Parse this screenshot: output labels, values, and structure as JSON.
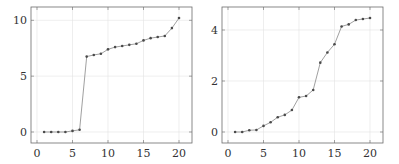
{
  "chart_data": [
    {
      "type": "line",
      "title": "",
      "xlabel": "",
      "ylabel": "",
      "x": [
        1,
        2,
        3,
        4,
        5,
        6,
        7,
        8,
        9,
        10,
        11,
        12,
        13,
        14,
        15,
        16,
        17,
        18,
        19,
        20
      ],
      "values": [
        0.0,
        0.0,
        0.0,
        0.0,
        0.1,
        0.2,
        6.75,
        6.9,
        7.0,
        7.4,
        7.6,
        7.7,
        7.8,
        7.9,
        8.2,
        8.4,
        8.5,
        8.6,
        9.3,
        10.2
      ],
      "xlim": [
        -1,
        22
      ],
      "ylim": [
        -1,
        11.2
      ],
      "xticks": [
        "0",
        "5",
        "10",
        "15",
        "20"
      ],
      "yticks": [
        "0",
        "5",
        "10"
      ],
      "grid": true,
      "legend": null
    },
    {
      "type": "line",
      "title": "",
      "xlabel": "",
      "ylabel": "",
      "x": [
        1,
        2,
        3,
        4,
        5,
        6,
        7,
        8,
        9,
        10,
        11,
        12,
        13,
        14,
        15,
        16,
        17,
        18,
        19,
        20
      ],
      "values": [
        0.0,
        0.0,
        0.07,
        0.08,
        0.24,
        0.38,
        0.58,
        0.67,
        0.86,
        1.36,
        1.41,
        1.65,
        2.72,
        3.12,
        3.44,
        4.14,
        4.22,
        4.39,
        4.43,
        4.47
      ],
      "xlim": [
        -1,
        22
      ],
      "ylim": [
        -0.43,
        4.9
      ],
      "xticks": [
        "0",
        "5",
        "10",
        "15",
        "20"
      ],
      "yticks": [
        "0",
        "2",
        "4"
      ],
      "grid": true,
      "legend": null
    }
  ],
  "panels": [
    {
      "frame": {
        "left": 31,
        "top": 7,
        "right": 192,
        "bottom": 143
      },
      "xmap": {
        "v0": 0,
        "p0": 37,
        "v1": 20,
        "p1": 179
      },
      "ymap": {
        "v0": 0,
        "p0": 132,
        "v1": 10,
        "p1": 20.3
      },
      "xtick_values": [
        0,
        5,
        10,
        15,
        20
      ],
      "ytick_values": [
        0,
        5,
        10
      ]
    },
    {
      "frame": {
        "left": 222,
        "top": 7,
        "right": 383,
        "bottom": 143
      },
      "xmap": {
        "v0": 0,
        "p0": 228,
        "v1": 20,
        "p1": 370
      },
      "ymap": {
        "v0": 0,
        "p0": 132,
        "v1": 4,
        "p1": 30
      },
      "xtick_values": [
        0,
        5,
        10,
        15,
        20
      ],
      "ytick_values": [
        0,
        2,
        4
      ]
    }
  ]
}
